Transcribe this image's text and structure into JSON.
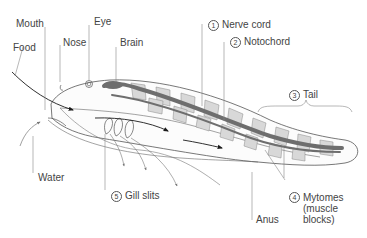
{
  "diagram": {
    "colors": {
      "outline": "#555555",
      "nerve_cord": "#6e6e6e",
      "notochord": "#6e6e6e",
      "myotome_fill": "#d8d8d8",
      "leader_line": "#888888",
      "flow_arrow": "#1a1a1a",
      "water_arrow": "#777777",
      "label_text": "#444444"
    },
    "labels": {
      "mouth": "Mouth",
      "eye": "Eye",
      "food": "Food",
      "nose": "Nose",
      "brain": "Brain",
      "nerve_cord": {
        "number": "1",
        "text": "Nerve cord"
      },
      "notochord": {
        "number": "2",
        "text": "Notochord"
      },
      "tail": {
        "number": "3",
        "text": "Tail"
      },
      "mytomes": {
        "number": "4",
        "text": "Mytomes\n(muscle\nblocks)"
      },
      "gill_slits": {
        "number": "5",
        "text": "Gill slits"
      },
      "water": "Water",
      "anus": "Anus"
    }
  }
}
